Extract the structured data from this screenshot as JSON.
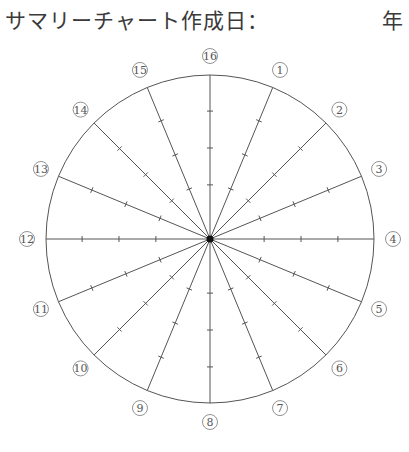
{
  "header": {
    "title": "サマリーチャート作成日：",
    "year_label": "年"
  },
  "chart": {
    "center": [
      210,
      239
    ],
    "radius": 164,
    "label_radius": 183,
    "tick_fractions": [
      0.33,
      0.555,
      0.78
    ],
    "spoke_labels": [
      "16",
      "1",
      "2",
      "3",
      "4",
      "5",
      "6",
      "7",
      "8",
      "9",
      "10",
      "11",
      "12",
      "13",
      "14",
      "15"
    ],
    "line_color": "#555555",
    "center_dot_color": "#111111"
  }
}
